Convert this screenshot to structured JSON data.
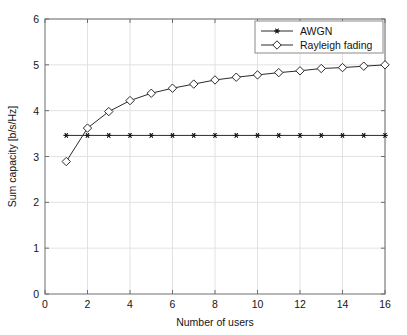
{
  "chart_data": {
    "type": "line",
    "title": "",
    "xlabel": "Number of users",
    "ylabel": "Sum capacity [b/s/Hz]",
    "xlim": [
      0,
      16
    ],
    "ylim": [
      0,
      6
    ],
    "xticks": [
      0,
      2,
      4,
      6,
      8,
      10,
      12,
      14,
      16
    ],
    "yticks": [
      0,
      1,
      2,
      3,
      4,
      5,
      6
    ],
    "xtick_labels": [
      "0",
      "2",
      "4",
      "6",
      "8",
      "10",
      "12",
      "14",
      "16"
    ],
    "ytick_labels": [
      "0",
      "1",
      "2",
      "3",
      "4",
      "5",
      "6"
    ],
    "grid": true,
    "legend_position": "top-right",
    "x": [
      1,
      2,
      3,
      4,
      5,
      6,
      7,
      8,
      9,
      10,
      11,
      12,
      13,
      14,
      15,
      16
    ],
    "series": [
      {
        "name": "AWGN",
        "marker": "star",
        "color": "#1a1a1a",
        "values": [
          3.46,
          3.46,
          3.46,
          3.46,
          3.46,
          3.46,
          3.46,
          3.46,
          3.46,
          3.46,
          3.46,
          3.46,
          3.46,
          3.46,
          3.46,
          3.46
        ]
      },
      {
        "name": "Rayleigh fading",
        "marker": "diamond",
        "color": "#2b2b2b",
        "values": [
          2.89,
          3.62,
          3.98,
          4.22,
          4.38,
          4.49,
          4.58,
          4.67,
          4.73,
          4.78,
          4.83,
          4.87,
          4.92,
          4.94,
          4.97,
          5.0
        ]
      }
    ]
  },
  "legend": {
    "entries": [
      {
        "label": "AWGN"
      },
      {
        "label": "Rayleigh fading"
      }
    ]
  },
  "axes": {
    "x_title": "Number of users",
    "y_title": "Sum capacity [b/s/Hz]"
  }
}
